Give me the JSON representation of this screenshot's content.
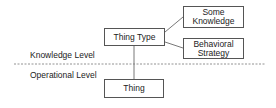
{
  "diagram": {
    "levels": {
      "knowledge": "Knowledge Level",
      "operational": "Operational Level"
    },
    "nodes": {
      "thing_type": "Thing Type",
      "some_knowledge_line1": "Some",
      "some_knowledge_line2": "Knowledge",
      "behavioral_strategy_line1": "Behavioral",
      "behavioral_strategy_line2": "Strategy",
      "thing": "Thing"
    },
    "edges": [
      {
        "from": "Thing Type",
        "to": "Some Knowledge"
      },
      {
        "from": "Thing Type",
        "to": "Behavioral Strategy"
      },
      {
        "from": "Thing Type",
        "to": "Thing"
      }
    ],
    "colors": {
      "line": "#555555",
      "divider": "#777777"
    }
  }
}
